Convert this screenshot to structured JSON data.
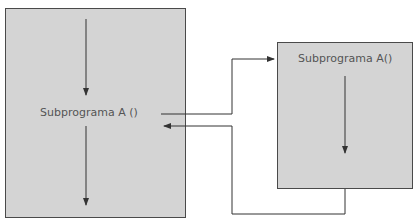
{
  "diagram": {
    "main_program": {
      "label": "Subprograma A ()"
    },
    "subprogram": {
      "label": "Subprograma A()"
    },
    "connections": [
      {
        "name": "call",
        "from": "main_program",
        "to": "subprogram"
      },
      {
        "name": "return",
        "from": "subprogram",
        "to": "main_program"
      }
    ],
    "colors": {
      "box_fill": "#d4d4d4",
      "line": "#333333",
      "text": "#555555"
    }
  }
}
